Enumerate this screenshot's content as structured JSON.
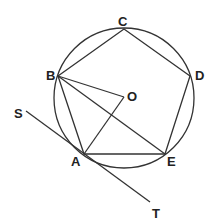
{
  "diagram": {
    "type": "geometry",
    "circle": {
      "center": "O"
    },
    "points": {
      "A": {
        "label": "A"
      },
      "B": {
        "label": "B"
      },
      "C": {
        "label": "C"
      },
      "D": {
        "label": "D"
      },
      "E": {
        "label": "E"
      },
      "O": {
        "label": "O"
      },
      "S": {
        "label": "S"
      },
      "T": {
        "label": "T"
      }
    },
    "segments": [
      "AB",
      "BC",
      "CD",
      "DE",
      "EA",
      "BO",
      "AO",
      "BE",
      "ST"
    ]
  }
}
